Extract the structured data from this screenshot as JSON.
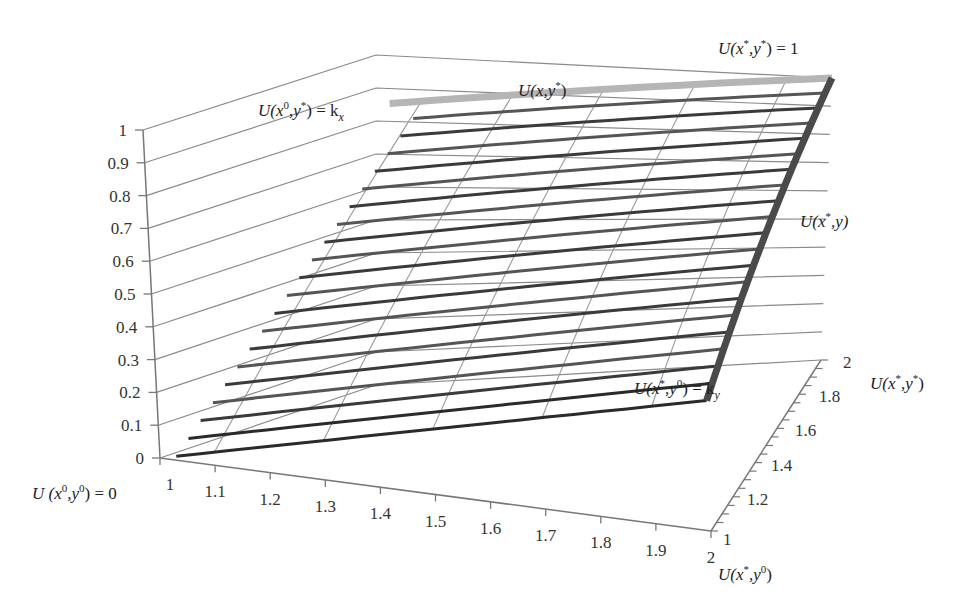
{
  "chart_data": {
    "type": "surface3d",
    "title": "",
    "x_axis": {
      "label": "U(x*,y0)",
      "ticks": [
        "1",
        "1.1",
        "1.2",
        "1.3",
        "1.4",
        "1.5",
        "1.6",
        "1.7",
        "1.8",
        "1.9",
        "2"
      ],
      "range": [
        1,
        2
      ]
    },
    "y_axis": {
      "label": "U(x*,y*)",
      "ticks": [
        "1",
        "1.2",
        "1.4",
        "1.6",
        "1.8",
        "2"
      ],
      "range": [
        1,
        2
      ]
    },
    "z_axis": {
      "label": "",
      "ticks": [
        "0",
        "0.1",
        "0.2",
        "0.3",
        "0.4",
        "0.5",
        "0.6",
        "0.7",
        "0.8",
        "0.9",
        "1"
      ],
      "range": [
        0,
        1
      ]
    },
    "surface": {
      "corners": {
        "U(x0,y0)": 0,
        "U(x*,y0)": 0.4,
        "U(x0,y*)": 0.85,
        "U(x*,y*)": 1
      },
      "series_count": 20,
      "highlight_series": [
        {
          "name": "U(x,y*)",
          "color": "#b5b5b5"
        },
        {
          "name": "U(x*,y)",
          "color": "#4a4a4a"
        }
      ]
    },
    "annotations": [
      {
        "text": "U(x*,y*) = 1",
        "position": "top-right"
      },
      {
        "text": "U(x,y*)",
        "position": "top-center"
      },
      {
        "text": "U(x0,y*) = kx",
        "position": "top-left"
      },
      {
        "text": "U(x*,y)",
        "position": "right"
      },
      {
        "text": "U(x*,y0) = ky",
        "position": "bottom-right-floor"
      },
      {
        "text": "U (x0,y0) = 0",
        "position": "bottom-left"
      },
      {
        "text": "U(x*,y*)",
        "position": "right-axis"
      },
      {
        "text": "U(x*,y0)",
        "position": "bottom-right"
      }
    ],
    "grid": true
  },
  "labels": {
    "top_right": {
      "main": "U(x",
      "sup1": "*",
      "mid": ",y",
      "sup2": "*",
      "end": ") = 1"
    },
    "top_center": {
      "main": "U(x,y",
      "sup1": "*",
      "end": ")"
    },
    "top_left": {
      "main": "U(x",
      "sup1": "0",
      "mid": ",y",
      "sup2": "*",
      "end": ") = k",
      "sub": "x"
    },
    "right_mid": {
      "main": "U(x",
      "sup1": "*",
      "end": ",y)"
    },
    "floor_right": {
      "main": "U(x",
      "sup1": "*",
      "mid": ",y",
      "sup2": "0",
      "end": ") = k",
      "sub": "y"
    },
    "origin": {
      "main": "U (x",
      "sup1": "0",
      "mid": ",y",
      "sup2": "0",
      "end": ") = 0"
    },
    "y_axis_title": {
      "main": "U(x",
      "sup1": "*",
      "mid": ",y",
      "sup2": "*",
      "end": ")"
    },
    "x_axis_title": {
      "main": "U(x",
      "sup1": "*",
      "mid": ",y",
      "sup2": "0",
      "end": ")"
    }
  },
  "colors": {
    "axis": "#777777",
    "grid": "#8a8a8a",
    "series_dark": "#3a3a3a",
    "series_mid": "#6a6a6a",
    "highlight_light": "#b5b5b5",
    "highlight_dark": "#4a4a4a"
  }
}
